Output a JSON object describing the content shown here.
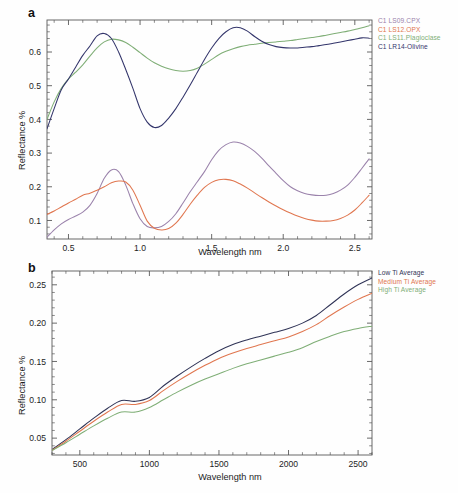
{
  "figure": {
    "panels": [
      {
        "letter": "a",
        "xlabel": "Wavelength nm",
        "ylabel": "Reflectance %"
      },
      {
        "letter": "b",
        "xlabel": "Wavelength nm",
        "ylabel": "Reflectance %"
      }
    ]
  },
  "legend_a": {
    "items": [
      {
        "label": "C1 LS09.CPX",
        "color": "#9a82ab"
      },
      {
        "label": "C1 LS12.OPX",
        "color": "#e0764f"
      },
      {
        "label": "C1 LS11.Plagioclase",
        "color": "#7fae76"
      },
      {
        "label": "C1 LR14-Olivine",
        "color": "#33356b"
      }
    ]
  },
  "legend_b": {
    "items": [
      {
        "label": "Low Ti Average",
        "color": "#2f3356"
      },
      {
        "label": "Medium Ti Average",
        "color": "#e0764f"
      },
      {
        "label": "High Ti Average",
        "color": "#7fae76"
      }
    ]
  },
  "chart_data": [
    {
      "type": "line",
      "panel": "a",
      "title": "",
      "xlabel": "Wavelength nm",
      "ylabel": "Reflectance %",
      "xlim": [
        0.35,
        2.62
      ],
      "ylim": [
        0.045,
        0.695
      ],
      "xticks": [
        0.5,
        1.0,
        1.5,
        2.0,
        2.5
      ],
      "xticklabels": [
        "0.5",
        "1.0",
        "1.5",
        "2.0",
        "2.5"
      ],
      "yticks": [
        0.1,
        0.2,
        0.3,
        0.4,
        0.5,
        0.6
      ],
      "yticklabels": [
        "0.1",
        "0.2",
        "0.3",
        "0.4",
        "0.5",
        "0.6"
      ],
      "grid": false,
      "legend_position": "outside-top-right",
      "x": [
        0.35,
        0.4,
        0.45,
        0.5,
        0.55,
        0.6,
        0.65,
        0.7,
        0.75,
        0.8,
        0.85,
        0.9,
        0.95,
        1.0,
        1.05,
        1.1,
        1.15,
        1.2,
        1.25,
        1.3,
        1.35,
        1.4,
        1.45,
        1.5,
        1.55,
        1.6,
        1.65,
        1.7,
        1.75,
        1.8,
        1.85,
        1.9,
        1.95,
        2.0,
        2.05,
        2.1,
        2.15,
        2.2,
        2.25,
        2.3,
        2.35,
        2.4,
        2.45,
        2.5,
        2.55,
        2.6
      ],
      "series": [
        {
          "name": "C1 LS09.CPX",
          "color": "#9a82ab",
          "values": [
            0.05,
            0.072,
            0.09,
            0.103,
            0.113,
            0.125,
            0.145,
            0.18,
            0.225,
            0.25,
            0.245,
            0.205,
            0.15,
            0.105,
            0.082,
            0.078,
            0.082,
            0.097,
            0.12,
            0.152,
            0.185,
            0.215,
            0.245,
            0.28,
            0.308,
            0.325,
            0.333,
            0.33,
            0.32,
            0.305,
            0.285,
            0.262,
            0.24,
            0.218,
            0.2,
            0.188,
            0.18,
            0.176,
            0.174,
            0.175,
            0.18,
            0.19,
            0.205,
            0.228,
            0.255,
            0.283
          ]
        },
        {
          "name": "C1 LS12.OPX",
          "color": "#e0764f",
          "values": [
            0.118,
            0.128,
            0.14,
            0.152,
            0.163,
            0.175,
            0.181,
            0.19,
            0.2,
            0.212,
            0.217,
            0.214,
            0.19,
            0.145,
            0.098,
            0.077,
            0.072,
            0.076,
            0.092,
            0.118,
            0.148,
            0.175,
            0.198,
            0.213,
            0.221,
            0.222,
            0.218,
            0.208,
            0.196,
            0.182,
            0.168,
            0.155,
            0.143,
            0.132,
            0.122,
            0.113,
            0.106,
            0.101,
            0.098,
            0.098,
            0.1,
            0.106,
            0.116,
            0.131,
            0.152,
            0.175
          ]
        },
        {
          "name": "C1 LS11.Plagioclase",
          "color": "#7fae76",
          "values": [
            0.4,
            0.452,
            0.492,
            0.52,
            0.54,
            0.562,
            0.588,
            0.612,
            0.63,
            0.638,
            0.636,
            0.628,
            0.614,
            0.598,
            0.582,
            0.568,
            0.558,
            0.55,
            0.545,
            0.543,
            0.545,
            0.552,
            0.564,
            0.578,
            0.592,
            0.602,
            0.61,
            0.616,
            0.62,
            0.623,
            0.626,
            0.628,
            0.63,
            0.632,
            0.634,
            0.637,
            0.64,
            0.643,
            0.646,
            0.65,
            0.654,
            0.658,
            0.662,
            0.667,
            0.672,
            0.678
          ]
        },
        {
          "name": "C1 LR14-Olivine",
          "color": "#33356b",
          "values": [
            0.372,
            0.432,
            0.488,
            0.52,
            0.555,
            0.59,
            0.618,
            0.648,
            0.655,
            0.64,
            0.6,
            0.548,
            0.492,
            0.432,
            0.392,
            0.376,
            0.382,
            0.404,
            0.432,
            0.466,
            0.502,
            0.54,
            0.578,
            0.612,
            0.64,
            0.66,
            0.672,
            0.672,
            0.662,
            0.646,
            0.632,
            0.622,
            0.616,
            0.613,
            0.612,
            0.612,
            0.614,
            0.616,
            0.619,
            0.622,
            0.626,
            0.63,
            0.634,
            0.638,
            0.642,
            0.641
          ]
        }
      ]
    },
    {
      "type": "line",
      "panel": "b",
      "title": "",
      "xlabel": "Wavelength nm",
      "ylabel": "Reflectance %",
      "xlim": [
        300,
        2600
      ],
      "ylim": [
        0.028,
        0.268
      ],
      "xticks": [
        500,
        1000,
        1500,
        2000,
        2500
      ],
      "xticklabels": [
        "500",
        "1000",
        "1500",
        "2000",
        "2500"
      ],
      "yticks": [
        0.05,
        0.1,
        0.15,
        0.2,
        0.25
      ],
      "yticklabels": [
        "0.05",
        "0.10",
        "0.15",
        "0.20",
        "0.25"
      ],
      "grid": false,
      "legend_position": "outside-top-right",
      "x": [
        300,
        400,
        500,
        600,
        700,
        800,
        900,
        1000,
        1100,
        1200,
        1300,
        1400,
        1500,
        1600,
        1700,
        1800,
        1900,
        2000,
        2100,
        2200,
        2300,
        2400,
        2500,
        2600
      ],
      "series": [
        {
          "name": "Low Ti Average",
          "color": "#2f3356",
          "values": [
            0.035,
            0.048,
            0.062,
            0.076,
            0.089,
            0.099,
            0.098,
            0.103,
            0.118,
            0.131,
            0.143,
            0.154,
            0.164,
            0.172,
            0.178,
            0.183,
            0.188,
            0.193,
            0.2,
            0.21,
            0.224,
            0.238,
            0.25,
            0.259
          ]
        },
        {
          "name": "Medium Ti Average",
          "color": "#e0764f",
          "values": [
            0.034,
            0.046,
            0.059,
            0.072,
            0.084,
            0.094,
            0.094,
            0.099,
            0.112,
            0.124,
            0.135,
            0.145,
            0.154,
            0.161,
            0.167,
            0.172,
            0.177,
            0.182,
            0.189,
            0.198,
            0.21,
            0.221,
            0.231,
            0.239
          ]
        },
        {
          "name": "High Ti Average",
          "color": "#7fae76",
          "values": [
            0.034,
            0.044,
            0.055,
            0.066,
            0.076,
            0.084,
            0.084,
            0.09,
            0.1,
            0.11,
            0.119,
            0.127,
            0.134,
            0.141,
            0.147,
            0.152,
            0.157,
            0.162,
            0.168,
            0.176,
            0.183,
            0.189,
            0.193,
            0.196
          ]
        }
      ]
    }
  ]
}
